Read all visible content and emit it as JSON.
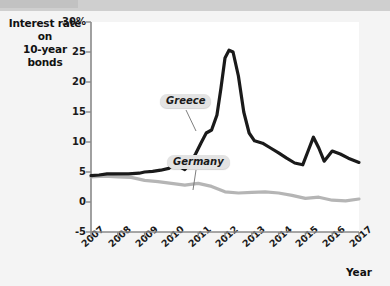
{
  "figure": {
    "y_axis_title_line1": "Interest rate on",
    "y_axis_title_line2": "10-year bonds",
    "x_axis_title": "Year"
  },
  "labels": {
    "greece": "Greece",
    "germany": "Germany"
  },
  "colors": {
    "greece_line": "#1a1a1a",
    "germany_line": "#b5b5b5",
    "axis": "#8a8a8a",
    "plot_background": "#ffffff",
    "page_background": "#f3f3f3",
    "callout_background": "#e3e3e3"
  },
  "chart_data": {
    "type": "line",
    "title": "Interest rate on 10-year bonds",
    "xlabel": "Year",
    "ylabel": "Interest rate on 10-year bonds",
    "xlim": [
      2007,
      2017
    ],
    "ylim": [
      -5,
      30
    ],
    "yticks": [
      -5,
      0,
      5,
      10,
      15,
      20,
      25,
      30
    ],
    "ytick_labels": [
      "-5",
      "0",
      "5",
      "10",
      "15",
      "20",
      "25",
      "30%"
    ],
    "xticks": [
      2007,
      2008,
      2009,
      2010,
      2011,
      2012,
      2013,
      2014,
      2015,
      2016,
      2017
    ],
    "xtick_labels": [
      "2007",
      "2008",
      "2009",
      "2010",
      "2011",
      "2012",
      "2013",
      "2014",
      "2015",
      "2016",
      "2017"
    ],
    "grid": false,
    "legend": "inline-callouts",
    "annotations": [
      {
        "text": "Greece",
        "series": "Greece",
        "x": 2010.4,
        "y": 21.0
      },
      {
        "text": "Germany",
        "series": "Germany",
        "x": 2011.6,
        "y": 10.5
      }
    ],
    "series": [
      {
        "name": "Greece",
        "color": "#1a1a1a",
        "x": [
          2007.0,
          2007.3,
          2007.6,
          2008.0,
          2008.4,
          2008.8,
          2009.0,
          2009.3,
          2009.6,
          2009.9,
          2010.1,
          2010.3,
          2010.5,
          2010.7,
          2010.9,
          2011.1,
          2011.3,
          2011.5,
          2011.7,
          2011.85,
          2012.0,
          2012.15,
          2012.3,
          2012.5,
          2012.7,
          2012.9,
          2013.1,
          2013.4,
          2013.7,
          2014.0,
          2014.3,
          2014.6,
          2014.9,
          2015.1,
          2015.3,
          2015.5,
          2015.7,
          2016.0,
          2016.3,
          2016.6,
          2017.0
        ],
        "y": [
          4.4,
          4.5,
          4.7,
          4.7,
          4.7,
          4.8,
          5.0,
          5.1,
          5.3,
          5.6,
          6.3,
          5.9,
          5.4,
          6.5,
          8.0,
          9.8,
          11.5,
          12.0,
          14.5,
          19.0,
          24.0,
          25.3,
          25.0,
          21.0,
          15.0,
          11.5,
          10.2,
          9.8,
          9.0,
          8.2,
          7.3,
          6.5,
          6.2,
          8.5,
          10.8,
          9.0,
          6.8,
          8.5,
          8.0,
          7.3,
          6.6
        ]
      },
      {
        "name": "Germany",
        "color": "#b5b5b5",
        "x": [
          2007.0,
          2007.5,
          2008.0,
          2008.5,
          2009.0,
          2009.5,
          2010.0,
          2010.5,
          2011.0,
          2011.5,
          2012.0,
          2012.5,
          2013.0,
          2013.5,
          2014.0,
          2014.5,
          2015.0,
          2015.5,
          2016.0,
          2016.5,
          2017.0
        ],
        "y": [
          4.2,
          4.3,
          4.2,
          4.1,
          3.6,
          3.4,
          3.1,
          2.8,
          3.1,
          2.6,
          1.7,
          1.5,
          1.6,
          1.7,
          1.5,
          1.1,
          0.6,
          0.8,
          0.3,
          0.2,
          0.5
        ]
      }
    ]
  }
}
